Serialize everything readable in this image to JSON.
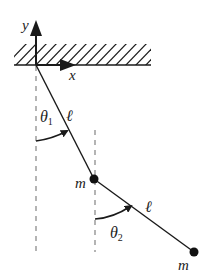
{
  "diagram": {
    "colors": {
      "ink": "#1a1a1a",
      "dash": "#777777",
      "background": "#ffffff"
    },
    "axes": {
      "x_label": "x",
      "y_label": "y"
    },
    "pivot": {
      "x": 36,
      "y": 65
    },
    "ceiling": {
      "x1": 14,
      "x2": 151,
      "y_base": 65,
      "y_top": 44
    },
    "links": [
      {
        "id": "rod1",
        "label": "ℓ",
        "from": [
          36,
          65
        ],
        "to": [
          94,
          179
        ]
      },
      {
        "id": "rod2",
        "label": "ℓ",
        "from": [
          94,
          179
        ],
        "to": [
          194,
          252
        ]
      }
    ],
    "masses": [
      {
        "id": "mass1",
        "label": "m",
        "x": 94,
        "y": 179,
        "r": 4.5
      },
      {
        "id": "mass2",
        "label": "m",
        "x": 194,
        "y": 252,
        "r": 4.5
      }
    ],
    "angles": [
      {
        "id": "theta1",
        "symbol": "θ",
        "subscript": "1"
      },
      {
        "id": "theta2",
        "symbol": "θ",
        "subscript": "2"
      }
    ]
  }
}
